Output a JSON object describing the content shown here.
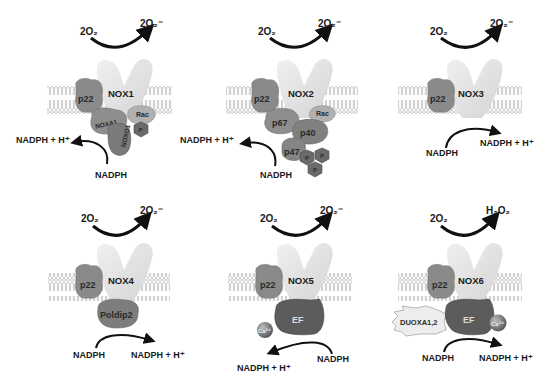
{
  "diagram": {
    "colors": {
      "nox_body": "#e2e2e2",
      "p22": "#8a8a8a",
      "subunit_dark": "#6f6f6f",
      "subunit_mid": "#9a9a9a",
      "ef": "#5c5c5c",
      "membrane": "#c8c8c8",
      "arrow": "#111111"
    },
    "panels": [
      {
        "id": "nox1",
        "enzyme": "NOX1",
        "substrate": "2O₂",
        "product": "2O₂⁻",
        "nadph": "NADPH",
        "nadph_h": "NADPH + H⁺",
        "subunits": [
          "p22",
          "NOXA1",
          "NOXO1",
          "Rac",
          "P"
        ]
      },
      {
        "id": "nox2",
        "enzyme": "NOX2",
        "substrate": "2O₂",
        "product": "2O₂⁻",
        "nadph": "NADPH",
        "nadph_h": "NADPH + H⁺",
        "subunits": [
          "p22",
          "p67",
          "p40",
          "Rac",
          "p47",
          "P",
          "P",
          "P"
        ]
      },
      {
        "id": "nox3",
        "enzyme": "NOX3",
        "substrate": "2O₂",
        "product": "2O₂⁻",
        "nadph": "NADPH",
        "nadph_h": "NADPH + H⁺",
        "subunits": [
          "p22"
        ]
      },
      {
        "id": "nox4",
        "enzyme": "NOX4",
        "substrate": "2O₂",
        "product": "2O₂⁻",
        "nadph": "NADPH",
        "nadph_h": "NADPH + H⁺",
        "subunits": [
          "p22",
          "Poldip2"
        ]
      },
      {
        "id": "nox5",
        "enzyme": "NOX5",
        "substrate": "2O₂",
        "product": "2O₂⁻",
        "nadph": "NADPH",
        "nadph_h": "NADPH + H⁺",
        "subunits": [
          "p22",
          "EF",
          "Ca²⁺"
        ]
      },
      {
        "id": "nox6",
        "enzyme": "NOX6",
        "substrate": "2O₂",
        "product": "H₂O₂",
        "nadph": "NADPH",
        "nadph_h": "NADPH + H⁺",
        "subunits": [
          "p22",
          "DUOXA1,2",
          "EF",
          "Ca²⁺"
        ]
      }
    ]
  }
}
